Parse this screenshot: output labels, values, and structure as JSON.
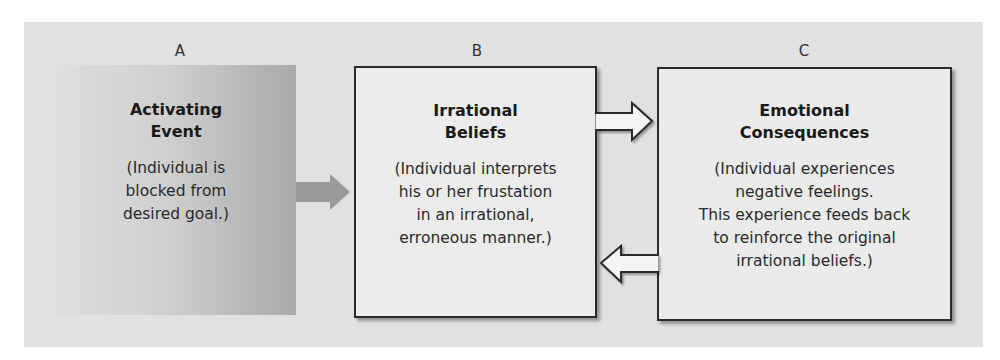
{
  "diagram": {
    "colors": {
      "panel": "#e1e1e1",
      "box_border": "#2a2a2a",
      "activating_arrow": "#9a9a9a",
      "outline_arrow_fill": "#f4f4f4"
    },
    "boxes": [
      {
        "letter": "A",
        "title": "Activating\nEvent",
        "description": "(Individual is\nblocked from\ndesired goal.)"
      },
      {
        "letter": "B",
        "title": "Irrational\nBeliefs",
        "description": "(Individual interprets\nhis or her frustation\nin an irrational,\nerroneous manner.)"
      },
      {
        "letter": "C",
        "title": "Emotional\nConsequences",
        "description": "(Individual experiences\nnegative feelings.\nThis experience feeds back\nto reinforce the original\nirrational beliefs.)"
      }
    ],
    "arrows": [
      {
        "from": "A",
        "to": "B",
        "style": "solid-gray"
      },
      {
        "from": "B",
        "to": "C",
        "style": "outline"
      },
      {
        "from": "C",
        "to": "B",
        "style": "outline"
      }
    ]
  }
}
